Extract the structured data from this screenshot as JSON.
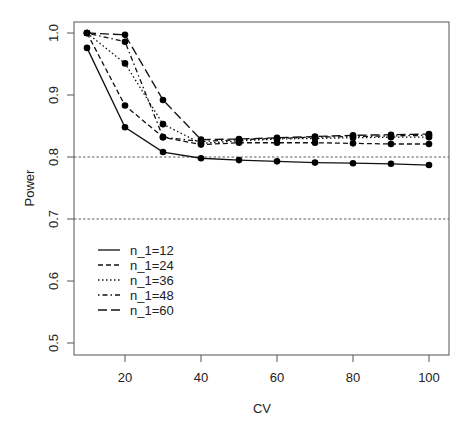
{
  "chart_data": {
    "type": "line",
    "title": "",
    "xlabel": "CV",
    "ylabel": "Power",
    "xlim": [
      6,
      104
    ],
    "ylim": [
      0.482,
      1.018
    ],
    "x": [
      10,
      20,
      30,
      40,
      50,
      60,
      70,
      80,
      90,
      100
    ],
    "xticks": [
      20,
      40,
      60,
      80,
      100
    ],
    "yticks": [
      0.5,
      0.6,
      0.7,
      0.8,
      0.9,
      1.0
    ],
    "ytick_labels": [
      "0.5",
      "0.6",
      "0.7",
      "0.8",
      "0.9",
      "1.0"
    ],
    "xtick_labels": [
      "20",
      "40",
      "60",
      "80",
      "100"
    ],
    "grid": false,
    "reference_lines": [
      0.8,
      0.7
    ],
    "legend_position": "left-center inside plot",
    "series": [
      {
        "name": "n_1=12",
        "linestyle": "solid",
        "values": [
          0.976,
          0.848,
          0.808,
          0.798,
          0.795,
          0.793,
          0.791,
          0.79,
          0.789,
          0.787
        ]
      },
      {
        "name": "n_1=24",
        "linestyle": "dashed",
        "values": [
          1.0,
          0.883,
          0.832,
          0.82,
          0.823,
          0.823,
          0.823,
          0.822,
          0.821,
          0.821
        ]
      },
      {
        "name": "n_1=36",
        "linestyle": "dotted",
        "values": [
          1.0,
          0.951,
          0.853,
          0.822,
          0.826,
          0.829,
          0.83,
          0.831,
          0.832,
          0.832
        ]
      },
      {
        "name": "n_1=48",
        "linestyle": "dotdash",
        "values": [
          1.0,
          0.986,
          0.832,
          0.825,
          0.828,
          0.83,
          0.832,
          0.833,
          0.834,
          0.835
        ]
      },
      {
        "name": "n_1=60",
        "linestyle": "longdash",
        "values": [
          1.0,
          0.997,
          0.892,
          0.828,
          0.829,
          0.831,
          0.833,
          0.835,
          0.836,
          0.837
        ]
      }
    ]
  }
}
